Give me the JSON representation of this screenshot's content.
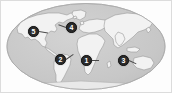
{
  "figure": {
    "type": "world-map-thumbnail",
    "projection": "elliptical world map",
    "alt": "Grayscale world map with five numbered location markers"
  },
  "colors": {
    "frame_border": "#dcdcdc",
    "page_background": "#ffffff",
    "ocean_fill": "#c9c9c9",
    "ocean_edge": "#b4b4b4",
    "land_fill": "#f2f2f2",
    "land_stroke": "#9a9a9a",
    "marker_fill": "#2b2b2b",
    "marker_text": "#ffffff",
    "leader_line": "#4a4a4a"
  },
  "markers": [
    {
      "id": "marker-5",
      "label": "5",
      "region": "north-pacific-west-of-north-america",
      "x": 27,
      "y": 25,
      "leader_length": 9,
      "leader_angle": 10
    },
    {
      "id": "marker-4",
      "label": "4",
      "region": "north-atlantic-greenland",
      "x": 65,
      "y": 21,
      "leader_length": 8,
      "leader_angle": 200
    },
    {
      "id": "marker-2",
      "label": "2",
      "region": "south-america",
      "x": 54,
      "y": 53,
      "leader_length": 9,
      "leader_angle": -35
    },
    {
      "id": "marker-1",
      "label": "1",
      "region": "africa",
      "x": 80,
      "y": 54,
      "leader_length": 8,
      "leader_angle": 0
    },
    {
      "id": "marker-3",
      "label": "3",
      "region": "indian-ocean",
      "x": 117,
      "y": 54,
      "leader_length": 8,
      "leader_angle": 25
    }
  ]
}
